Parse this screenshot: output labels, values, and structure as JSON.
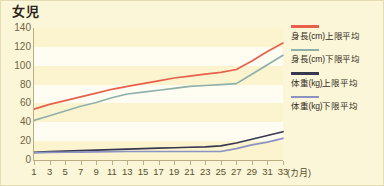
{
  "chart_data": {
    "type": "line",
    "title": "女児",
    "xlabel": "(カ月)",
    "ylabel": "",
    "x": [
      1,
      3,
      5,
      7,
      9,
      11,
      13,
      15,
      17,
      19,
      21,
      23,
      25,
      27,
      29,
      31,
      33
    ],
    "xtick_labels": [
      "1",
      "3",
      "5",
      "7",
      "9",
      "11",
      "13",
      "15",
      "17",
      "19",
      "21",
      "23",
      "25",
      "27",
      "29",
      "31",
      "33"
    ],
    "ytick_labels": [
      "0",
      "20",
      "40",
      "60",
      "80",
      "100",
      "120",
      "140"
    ],
    "ylim": [
      0,
      140
    ],
    "xlim": [
      1,
      33
    ],
    "grid": "horizontal-bands",
    "legend_position": "right",
    "series": [
      {
        "name": "身長(cm)上限平均",
        "color": "#e8604c",
        "values": [
          54,
          59,
          63,
          67,
          71,
          75,
          78,
          81,
          84,
          87,
          89,
          91,
          93,
          96,
          105,
          115,
          124
        ]
      },
      {
        "name": "身長(cm)下限平均",
        "color": "#8fb0a8",
        "values": [
          42,
          47,
          52,
          57,
          61,
          66,
          70,
          72,
          74,
          76,
          78,
          79,
          80,
          81,
          91,
          101,
          111
        ]
      },
      {
        "name": "体重(kg)上限平均",
        "color": "#37374f",
        "values": [
          8,
          9,
          9.5,
          10,
          10.5,
          11,
          11.5,
          12,
          12.5,
          13,
          13.5,
          14,
          15,
          18,
          22,
          26,
          30
        ]
      },
      {
        "name": "体重(kg)下限平均",
        "color": "#8d92c4",
        "values": [
          7.5,
          8,
          8.2,
          8.4,
          8.6,
          8.8,
          9,
          9,
          9,
          9,
          9,
          9,
          9,
          12,
          16,
          19,
          23
        ]
      }
    ]
  },
  "colors": {
    "background": "#fcf6d8",
    "band_white": "#fffdf2",
    "band_cream": "#fbf4cf",
    "axis": "#b9ae84",
    "text": "#57502f",
    "title": "#2a2419"
  }
}
